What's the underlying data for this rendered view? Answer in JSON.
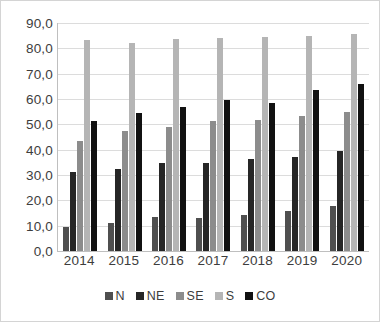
{
  "chart_data": {
    "type": "bar",
    "title": "",
    "subtitle": "",
    "xlabel": "",
    "ylabel": "",
    "categories": [
      "2014",
      "2015",
      "2016",
      "2017",
      "2018",
      "2019",
      "2020"
    ],
    "series": [
      {
        "name": "N",
        "color": "#4f4f4f",
        "values": [
          9.5,
          11.0,
          13.3,
          13.0,
          14.2,
          15.8,
          17.6
        ]
      },
      {
        "name": "NE",
        "color": "#262626",
        "values": [
          31.2,
          32.5,
          34.8,
          34.8,
          36.3,
          37.1,
          39.3
        ]
      },
      {
        "name": "SE",
        "color": "#8c8c8c",
        "values": [
          43.6,
          47.2,
          48.8,
          51.2,
          51.9,
          53.3,
          54.7
        ]
      },
      {
        "name": "S",
        "color": "#b5b5b5",
        "values": [
          83.3,
          82.0,
          83.6,
          84.0,
          84.5,
          84.7,
          85.5
        ]
      },
      {
        "name": "CO",
        "color": "#111111",
        "values": [
          51.2,
          54.6,
          56.8,
          59.8,
          58.3,
          63.4,
          66.1
        ]
      }
    ],
    "ylim": [
      0,
      90
    ],
    "yticks": [
      "0,0",
      "10,0",
      "20,0",
      "30,0",
      "40,0",
      "50,0",
      "60,0",
      "70,0",
      "80,0",
      "90,0"
    ],
    "ytick_values": [
      0,
      10,
      20,
      30,
      40,
      50,
      60,
      70,
      80,
      90
    ],
    "grid": true,
    "legend_position": "bottom",
    "decimal_separator": ","
  }
}
